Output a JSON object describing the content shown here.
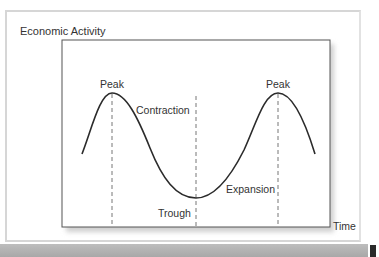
{
  "diagram": {
    "y_axis_label": "Economic Activity",
    "x_axis_label": "Time",
    "phase_labels": {
      "peak_left": "Peak",
      "contraction": "Contraction",
      "trough": "Trough",
      "expansion": "Expansion",
      "peak_right": "Peak"
    },
    "colors": {
      "curve": "#2b2b2b",
      "axes": "#555555",
      "dashed": "#777777",
      "frame": "#d6d6d6",
      "band": "#b0b0b0"
    }
  }
}
